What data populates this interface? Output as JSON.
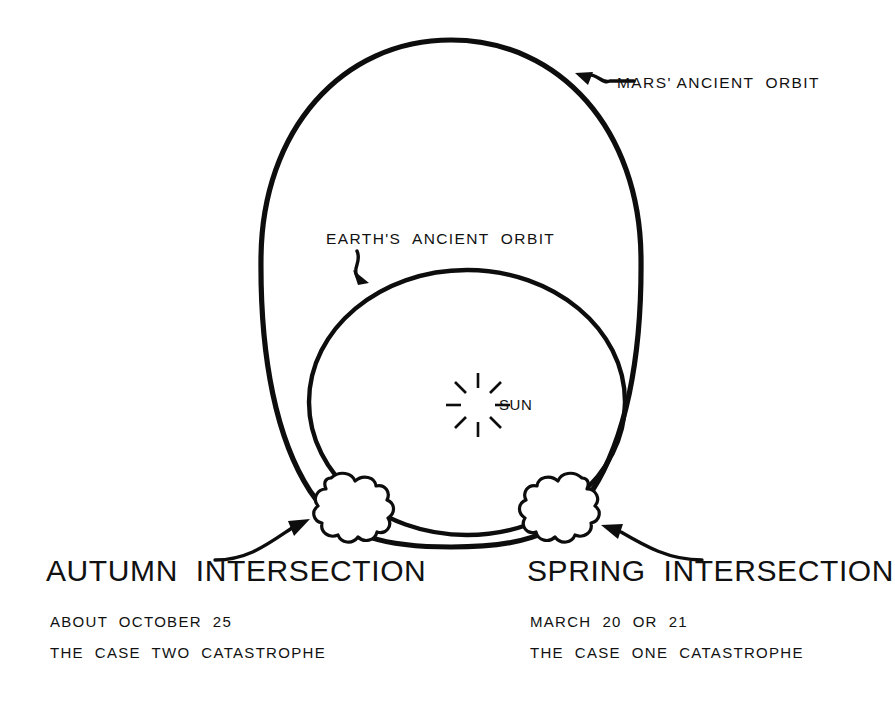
{
  "diagram": {
    "background_color": "#ffffff",
    "ink_color": "#0d0d0d"
  },
  "orbits": {
    "mars": {
      "label": "MARS' ANCIENT  ORBIT",
      "shape": "egg",
      "leader_icon": "arrow-leader-icon"
    },
    "earth": {
      "label": "EARTH'S  ANCIENT  ORBIT",
      "shape": "circle",
      "leader_icon": "arrow-leader-icon"
    }
  },
  "sun": {
    "label": "SUN",
    "icon": "sun-starburst-icon",
    "rays": 8
  },
  "intersections": [
    {
      "id": "autumn",
      "heading": "AUTUMN  INTERSECTION",
      "date_line": "ABOUT  OCTOBER  25",
      "case_line": "THE  CASE  TWO  CATASTROPHE",
      "marker_icon": "collision-puff-icon",
      "arrow_icon": "curved-arrow-icon"
    },
    {
      "id": "spring",
      "heading": "SPRING  INTERSECTION",
      "date_line": "MARCH  20  OR  21",
      "case_line": "THE  CASE  ONE  CATASTROPHE",
      "marker_icon": "collision-puff-icon",
      "arrow_icon": "curved-arrow-icon"
    }
  ]
}
